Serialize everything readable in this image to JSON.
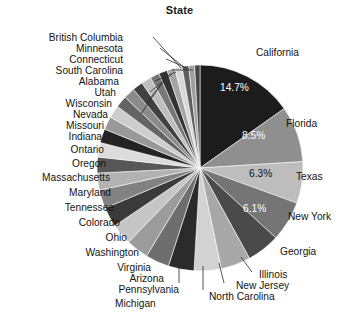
{
  "chart": {
    "title": "State",
    "type": "pie"
  },
  "chart_data": {
    "type": "pie",
    "title": "State",
    "xlabel": "",
    "ylabel": "",
    "legend": "none",
    "grid": false,
    "labels_position": "outside-with-leader-lines",
    "percent_labels_shown": [
      "14.7%",
      "8.5%",
      "6.3%",
      "6.1%"
    ],
    "categories": [
      "California",
      "Florida",
      "Texas",
      "New York",
      "Georgia",
      "Illinois",
      "New Jersey",
      "North Carolina",
      "Michigan",
      "Pennsylvania",
      "Arizona",
      "Virginia",
      "Washington",
      "Ohio",
      "Colorado",
      "Tennessee",
      "Maryland",
      "Massachusetts",
      "Oregon",
      "Ontario",
      "Indiana",
      "Missouri",
      "Nevada",
      "Wisconsin",
      "Utah",
      "Alabama",
      "South Carolina",
      "Connecticut",
      "Minnesota",
      "British Columbia"
    ],
    "values": [
      14.7,
      8.5,
      6.3,
      6.1,
      5.0,
      4.5,
      4.1,
      3.9,
      3.6,
      3.4,
      3.2,
      3.0,
      2.8,
      2.6,
      2.4,
      2.2,
      2.1,
      2.0,
      1.9,
      1.8,
      1.7,
      1.6,
      1.5,
      1.4,
      1.3,
      1.2,
      1.1,
      1.0,
      0.9,
      0.8
    ],
    "units": "percent",
    "slice_colors": [
      "#1c1c1c",
      "#8f8f8f",
      "#bdbdbd",
      "#757575",
      "#4a4a4a",
      "#a8a8a8",
      "#d2d2d2",
      "#2b2b2b",
      "#6e6e6e",
      "#9c9c9c",
      "#c6c6c6",
      "#3a3a3a",
      "#828282",
      "#b2b2b2",
      "#575757",
      "#dcdcdc",
      "#242424",
      "#999999",
      "#cdcdcd",
      "#646464",
      "#8a8a8a",
      "#414141",
      "#bebebe",
      "#777777",
      "#333333",
      "#a4a4a4",
      "#d8d8d8",
      "#5e5e5e",
      "#9f9f9f",
      "#454545"
    ]
  },
  "labels_right": [
    {
      "text": "California",
      "pct": "14.7%"
    },
    {
      "text": "Florida",
      "pct": "8.5%"
    },
    {
      "text": "Texas",
      "pct": "6.3%"
    },
    {
      "text": "New York",
      "pct": "6.1%"
    },
    {
      "text": "Georgia",
      "pct": ""
    },
    {
      "text": "Illinois",
      "pct": ""
    },
    {
      "text": "New Jersey",
      "pct": ""
    },
    {
      "text": "North Carolina",
      "pct": ""
    }
  ],
  "labels_bottom": [
    {
      "text": "Michigan"
    }
  ],
  "labels_left": [
    {
      "text": "British Columbia"
    },
    {
      "text": "Minnesota"
    },
    {
      "text": "Connecticut"
    },
    {
      "text": "South Carolina"
    },
    {
      "text": "Alabama"
    },
    {
      "text": "Utah"
    },
    {
      "text": "Wisconsin"
    },
    {
      "text": "Nevada"
    },
    {
      "text": "Missouri"
    },
    {
      "text": "Indiana"
    },
    {
      "text": "Ontario"
    },
    {
      "text": "Oregon"
    },
    {
      "text": "Massachusetts"
    },
    {
      "text": "Maryland"
    },
    {
      "text": "Tennessee"
    },
    {
      "text": "Colorado"
    },
    {
      "text": "Ohio"
    },
    {
      "text": "Washington"
    },
    {
      "text": "Virginia"
    },
    {
      "text": "Arizona"
    },
    {
      "text": "Pennsylvania"
    }
  ],
  "percent_overlays": [
    {
      "text": "14.7%",
      "tone": "on-dark"
    },
    {
      "text": "8.5%",
      "tone": "on-dark"
    },
    {
      "text": "6.3%",
      "tone": "on-light"
    },
    {
      "text": "6.1%",
      "tone": "on-dark"
    }
  ]
}
